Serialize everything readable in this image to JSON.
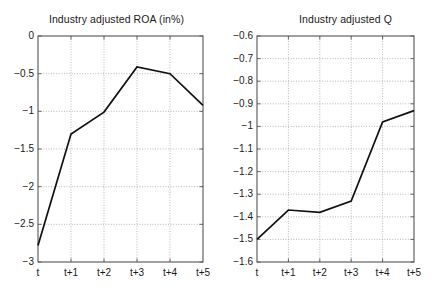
{
  "chart_data": [
    {
      "id": "roa",
      "type": "line",
      "title": "Industry adjusted ROA (in%)",
      "xlabel": "",
      "ylabel": "",
      "categories": [
        "t",
        "t+1",
        "t+2",
        "t+3",
        "t+4",
        "t+5"
      ],
      "values": [
        -2.78,
        -1.3,
        -1.01,
        -0.41,
        -0.5,
        -0.92
      ],
      "ylim": [
        -3,
        0
      ],
      "yticks": [
        0,
        -0.5,
        -1,
        -1.5,
        -2,
        -2.5,
        -3
      ],
      "ytick_labels": [
        "0",
        "−0.5",
        "−1",
        "−1.5",
        "−2",
        "−2.5",
        "−3"
      ],
      "grid": true,
      "grid_style": "dotted",
      "legend": "none",
      "line_color": "#000000"
    },
    {
      "id": "q",
      "type": "line",
      "title": "Industry adjusted Q",
      "xlabel": "",
      "ylabel": "",
      "categories": [
        "t",
        "t+1",
        "t+2",
        "t+3",
        "t+4",
        "t+5"
      ],
      "values": [
        -1.5,
        -1.37,
        -1.38,
        -1.33,
        -0.98,
        -0.93
      ],
      "ylim": [
        -1.6,
        -0.6
      ],
      "yticks": [
        -0.6,
        -0.7,
        -0.8,
        -0.9,
        -1,
        -1.1,
        -1.2,
        -1.3,
        -1.4,
        -1.5,
        -1.6
      ],
      "ytick_labels": [
        "−0.6",
        "−0.7",
        "−0.8",
        "−0.9",
        "−1",
        "−1.1",
        "−1.2",
        "−1.3",
        "−1.4",
        "−1.5",
        "−1.6"
      ],
      "grid": true,
      "grid_style": "dotted",
      "legend": "none",
      "line_color": "#000000"
    }
  ],
  "figures": {
    "roa": {
      "title": "Industry adjusted ROA (in%)"
    },
    "q": {
      "title": "Industry adjusted Q"
    }
  },
  "colors": {
    "background": "#ffffff",
    "axis": "#555555",
    "grid": "#9a9a9a",
    "line": "#111111",
    "text": "#1a1a1a"
  }
}
